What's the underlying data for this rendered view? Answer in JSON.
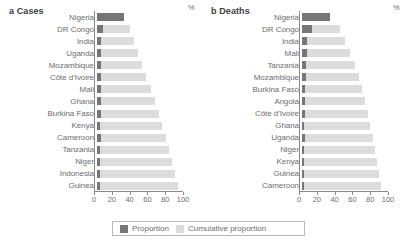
{
  "figure": {
    "legend": {
      "items": [
        {
          "label": "Proportion",
          "color": "#767679",
          "key": "proportion"
        },
        {
          "label": "Cumulative proportion",
          "color": "#dcdcdc",
          "key": "cumulative"
        }
      ]
    }
  },
  "chart_data": [
    {
      "type": "bar",
      "panel": "a",
      "title": "a Cases",
      "xlabel": "%",
      "ylabel": "",
      "xlim": [
        0,
        100
      ],
      "xticks": [
        0,
        20,
        40,
        60,
        80,
        100
      ],
      "xtick_labels": [
        "0",
        "20",
        "40",
        "60",
        "80",
        "100"
      ],
      "unit_label": "%",
      "grid": false,
      "orientation": "horizontal",
      "legend_position": "bottom-center",
      "categories": [
        "Nigeria",
        "DR Congo",
        "India",
        "Uganda",
        "Mozambique",
        "Côte d'Ivoire",
        "Mali",
        "Ghana",
        "Burkina Faso",
        "Kenya",
        "Cameroon",
        "Tanzania",
        "Niger",
        "Indonesia",
        "Guinea"
      ],
      "series": [
        {
          "name": "Cumulative proportion",
          "color": "#dcdcdc",
          "values": [
            27,
            33,
            37,
            41,
            45,
            49,
            53,
            57,
            61,
            64,
            68,
            71,
            74,
            77,
            80
          ]
        },
        {
          "name": "Proportion",
          "color": "#767679",
          "values": [
            27,
            6,
            4,
            4,
            4,
            4,
            4,
            4,
            4,
            3,
            4,
            3,
            3,
            3,
            3
          ]
        }
      ]
    },
    {
      "type": "bar",
      "panel": "b",
      "title": "b Deaths",
      "xlabel": "%",
      "ylabel": "",
      "xlim": [
        0,
        100
      ],
      "xticks": [
        0,
        20,
        40,
        60,
        80,
        100
      ],
      "xtick_labels": [
        "0",
        "20",
        "40",
        "60",
        "80",
        "100"
      ],
      "unit_label": "%",
      "grid": false,
      "orientation": "horizontal",
      "legend_position": "bottom-center",
      "categories": [
        "Nigeria",
        "DR Congo",
        "India",
        "Mali",
        "Tanzania",
        "Mozambique",
        "Burkina Faso",
        "Angola",
        "Côte d'Ivoire",
        "Ghana",
        "Uganda",
        "Niger",
        "Kenya",
        "Guinea",
        "Cameroon"
      ],
      "series": [
        {
          "name": "Cumulative proportion",
          "color": "#dcdcdc",
          "values": [
            27,
            37,
            42,
            47,
            51,
            55,
            58,
            61,
            64,
            66,
            69,
            71,
            73,
            75,
            77
          ]
        },
        {
          "name": "Proportion",
          "color": "#767679",
          "values": [
            27,
            10,
            5,
            5,
            4,
            4,
            3,
            3,
            3,
            2,
            3,
            2,
            2,
            2,
            2
          ]
        }
      ]
    }
  ]
}
